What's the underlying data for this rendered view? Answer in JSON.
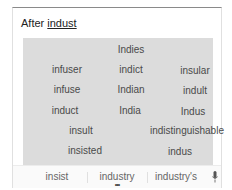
{
  "prompt": {
    "prefix": "After",
    "word": "indust"
  },
  "predictions": [
    {
      "text": "Indies",
      "x": 108,
      "y": 12
    },
    {
      "text": "infuser",
      "x": 44,
      "y": 32
    },
    {
      "text": "indict",
      "x": 108,
      "y": 32
    },
    {
      "text": "insular",
      "x": 172,
      "y": 33
    },
    {
      "text": "infuse",
      "x": 44,
      "y": 52
    },
    {
      "text": "Indian",
      "x": 108,
      "y": 52
    },
    {
      "text": "indult",
      "x": 172,
      "y": 53
    },
    {
      "text": "induct",
      "x": 42,
      "y": 73
    },
    {
      "text": "India",
      "x": 107,
      "y": 73
    },
    {
      "text": "Indus",
      "x": 170,
      "y": 74
    },
    {
      "text": "insult",
      "x": 58,
      "y": 93
    },
    {
      "text": "indistinguishable",
      "x": 164,
      "y": 93
    },
    {
      "text": "insisted",
      "x": 62,
      "y": 113
    },
    {
      "text": "indus",
      "x": 157,
      "y": 114
    }
  ],
  "suggestion_bar": {
    "items": [
      {
        "text": "insist",
        "x": 44
      },
      {
        "text": "industry",
        "x": 104
      },
      {
        "text": "industry's",
        "x": 163
      }
    ],
    "more_indicator": "•••",
    "mic_icon": "microphone-icon"
  },
  "colors": {
    "grid_bg": "#dcdcdc",
    "word_text": "#4a4a4a",
    "suggestion_text": "#666666"
  }
}
